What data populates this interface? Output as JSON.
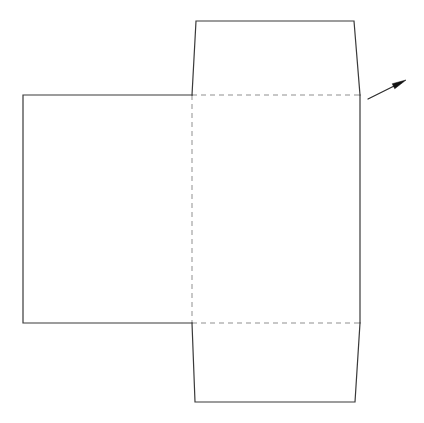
{
  "diagram": {
    "type": "line-drawing",
    "background_color": "#ffffff",
    "cut_line_color": "#3a3a3a",
    "fold_line_color": "#8f8f8f",
    "arrow_color": "#111111",
    "canvas": {
      "width": 424,
      "height": 423
    },
    "panels": [
      {
        "name": "left-panel",
        "shape": "rectangle",
        "points": "23,95 192,95 192,323 23,323",
        "edge_style": "solid"
      },
      {
        "name": "center-panel",
        "shape": "rectangle",
        "points": "192,95 360,95 360,323 192,323",
        "edge_style": "mixed-dashed-solid"
      },
      {
        "name": "top-flap",
        "shape": "trapezoid",
        "points": "192,95 196,21 354,21 360,95",
        "edge_style": "solid"
      },
      {
        "name": "bottom-flap",
        "shape": "trapezoid",
        "points": "192,323 195,402 355,402 360,323",
        "edge_style": "solid"
      }
    ],
    "fold_lines": [
      {
        "name": "vertical-fold",
        "from": "192,95",
        "to": "192,323"
      },
      {
        "name": "top-horizontal-fold",
        "from": "192,95",
        "to": "360,95"
      },
      {
        "name": "bottom-horizontal-fold",
        "from": "192,323",
        "to": "360,323"
      }
    ],
    "callout_arrow": {
      "name": "leader-arrow",
      "tail": "368,99",
      "tip": "406,80",
      "label": ""
    }
  }
}
